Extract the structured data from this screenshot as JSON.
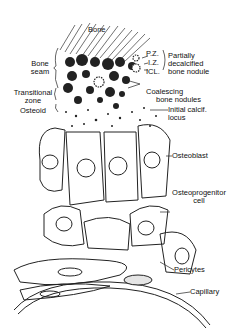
{
  "figure": {
    "labels": {
      "bone": "Bone",
      "bone_seam_1": "Bone",
      "bone_seam_2": "seam",
      "pz": "P.Z.",
      "iz": "I.Z.",
      "icl": "ICL.",
      "partially_1": "Partially",
      "partially_2": "decalcified",
      "partially_3": "bone nodule",
      "transitional_1": "Transitional",
      "transitional_2": "zone",
      "coalescing_1": "Coalescing",
      "coalescing_2": "bone nodules",
      "osteoid": "Osteoid",
      "initial_1": "Initial calcif.",
      "initial_2": "locus",
      "osteoblast": "Osteoblast",
      "osteoprogenitor_1": "Osteoprogenitor",
      "osteoprogenitor_2": "cell",
      "pericytes": "Pericytes",
      "capillary": "Capillary"
    },
    "colors": {
      "ink": "#111111",
      "shade": "#cfcfcf"
    }
  }
}
